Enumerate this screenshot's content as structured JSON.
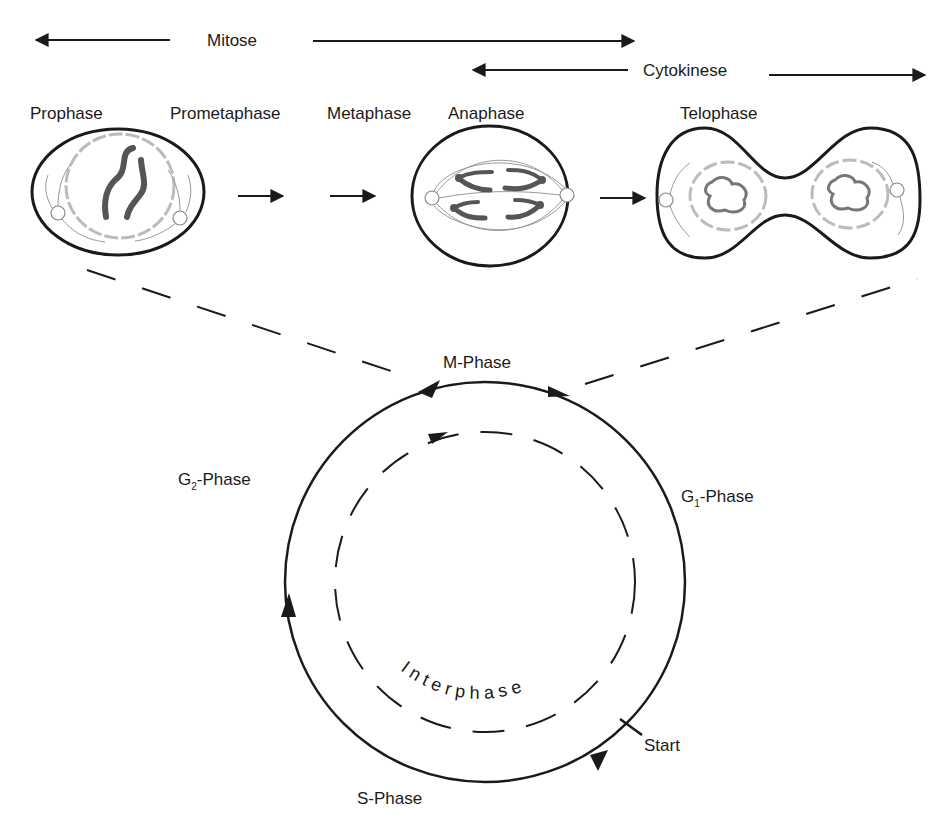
{
  "header": {
    "mitose": "Mitose",
    "cytokinese": "Cytokinese"
  },
  "phases": [
    {
      "label": "Prophase"
    },
    {
      "label": "Prometaphase"
    },
    {
      "label": "Metaphase"
    },
    {
      "label": "Anaphase"
    },
    {
      "label": "Telophase"
    }
  ],
  "cycle": {
    "m_phase": "M-Phase",
    "g2_prefix": "G",
    "g2_sub": "2",
    "g2_suffix": "-Phase",
    "g1_prefix": "G",
    "g1_sub": "1",
    "g1_suffix": "-Phase",
    "s_phase": "S-Phase",
    "start": "Start",
    "interphase": "Interphase"
  },
  "icons": {
    "arrow": "arrow-right",
    "cell": "cell-drawing"
  },
  "colors": {
    "ink": "#1a1a1a",
    "chromosome": "#555555",
    "nucleus": "#b8b8b8",
    "spindle": "#9a9a9a"
  }
}
